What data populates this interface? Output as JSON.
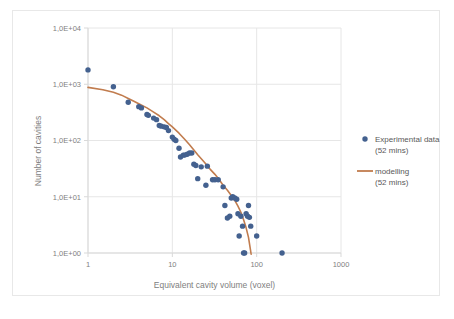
{
  "chart_data": {
    "type": "scatter",
    "title": "",
    "xlabel": "Equivalent cavity volume (voxel)",
    "ylabel": "Number of cavities",
    "xscale": "log",
    "yscale": "log",
    "xlim": [
      1,
      1000
    ],
    "ylim": [
      1,
      10000
    ],
    "grid": true,
    "legend_position": "right",
    "x_tick_labels": [
      "1",
      "10",
      "100",
      "1000"
    ],
    "x_tick_values": [
      1,
      10,
      100,
      1000
    ],
    "y_tick_labels": [
      "1,0E+00",
      "1,0E+01",
      "1,0E+02",
      "1,0E+03",
      "1,0E+04"
    ],
    "y_tick_values": [
      1,
      10,
      100,
      1000,
      10000
    ],
    "series": [
      {
        "name": "Experimental data (52 mins)",
        "type": "scatter",
        "marker": "circle",
        "color": "#44618f",
        "points": [
          [
            1,
            1800
          ],
          [
            2,
            900
          ],
          [
            3,
            480
          ],
          [
            4,
            400
          ],
          [
            4.3,
            380
          ],
          [
            5,
            290
          ],
          [
            5.2,
            280
          ],
          [
            6,
            250
          ],
          [
            6.5,
            235
          ],
          [
            7,
            185
          ],
          [
            7.4,
            180
          ],
          [
            8,
            175
          ],
          [
            8.5,
            170
          ],
          [
            9,
            150
          ],
          [
            10,
            115
          ],
          [
            10.5,
            105
          ],
          [
            11,
            100
          ],
          [
            12,
            73
          ],
          [
            12.5,
            51
          ],
          [
            13.5,
            55
          ],
          [
            14,
            55
          ],
          [
            15,
            57
          ],
          [
            16,
            60
          ],
          [
            17,
            60
          ],
          [
            18,
            38
          ],
          [
            19,
            36
          ],
          [
            20,
            21
          ],
          [
            22,
            34
          ],
          [
            25,
            16
          ],
          [
            26,
            35
          ],
          [
            30,
            20
          ],
          [
            32,
            20
          ],
          [
            35,
            20
          ],
          [
            40,
            15
          ],
          [
            42,
            7
          ],
          [
            45,
            4.2
          ],
          [
            48,
            4.5
          ],
          [
            50,
            9.5
          ],
          [
            52,
            10
          ],
          [
            55,
            9.5
          ],
          [
            58,
            9
          ],
          [
            60,
            5
          ],
          [
            62,
            2
          ],
          [
            65,
            4.5
          ],
          [
            68,
            3
          ],
          [
            70,
            1
          ],
          [
            72,
            1
          ],
          [
            75,
            5
          ],
          [
            78,
            4.5
          ],
          [
            80,
            7
          ],
          [
            82,
            4.3
          ],
          [
            85,
            3
          ],
          [
            100,
            2
          ],
          [
            200,
            1
          ]
        ]
      },
      {
        "name": "modelling (52 mins)",
        "type": "line",
        "color": "#c17c4e",
        "points": [
          [
            1,
            880
          ],
          [
            1.5,
            800
          ],
          [
            2,
            720
          ],
          [
            2.5,
            640
          ],
          [
            3,
            560
          ],
          [
            3.5,
            500
          ],
          [
            4,
            450
          ],
          [
            5,
            380
          ],
          [
            6,
            320
          ],
          [
            7,
            275
          ],
          [
            8,
            235
          ],
          [
            9,
            200
          ],
          [
            10,
            175
          ],
          [
            12,
            135
          ],
          [
            14,
            105
          ],
          [
            16,
            84
          ],
          [
            18,
            68
          ],
          [
            20,
            56
          ],
          [
            24,
            41
          ],
          [
            28,
            31
          ],
          [
            32,
            25
          ],
          [
            36,
            20
          ],
          [
            40,
            16
          ],
          [
            45,
            13
          ],
          [
            50,
            10.5
          ],
          [
            55,
            8.6
          ],
          [
            60,
            6.8
          ],
          [
            65,
            5.3
          ],
          [
            70,
            3.9
          ],
          [
            75,
            2.8
          ],
          [
            80,
            1.9
          ],
          [
            84,
            1.2
          ],
          [
            86,
            0.95
          ]
        ]
      }
    ]
  },
  "legend": {
    "items": [
      {
        "label": "Experimental data (52 mins)",
        "marker": "circle",
        "color": "#44618f"
      },
      {
        "label": "modelling (52 mins)",
        "marker": "line",
        "color": "#c17c4e"
      }
    ]
  },
  "colors": {
    "experimental": "#44618f",
    "modelling": "#c17c4e",
    "grid": "#e6e6e6",
    "axis": "#d9d9d9",
    "text": "#808080",
    "border": "#e8e8e8",
    "background": "#ffffff"
  }
}
